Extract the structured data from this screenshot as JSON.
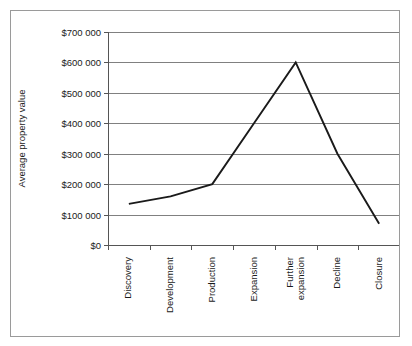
{
  "chart_data": {
    "type": "line",
    "title": "",
    "subtitle": "",
    "xlabel": "",
    "ylabel": "Average property value",
    "categories": [
      "Discovery",
      "Development",
      "Production",
      "Expansion",
      "Further expansion",
      "Decline",
      "Closure"
    ],
    "series": [
      {
        "name": "Average property value",
        "values": [
          135000,
          160000,
          200000,
          400000,
          600000,
          300000,
          70000
        ]
      }
    ],
    "ylim": [
      0,
      700000
    ],
    "ytick_values": [
      0,
      100000,
      200000,
      300000,
      400000,
      500000,
      600000,
      700000
    ],
    "ytick_labels": [
      "$0",
      "$100 000",
      "$200 000",
      "$300 000",
      "$400 000",
      "$500 000",
      "$600 000",
      "$700 000"
    ],
    "grid": true,
    "grid_axis": "y",
    "legend": false,
    "legend_position": "none",
    "line_color": "#1a1a1a",
    "grid_color": "#808080",
    "axis_color": "#555555",
    "plot_background": "#ffffff",
    "border_color": "#9a9a9a",
    "markers": false,
    "annotations": []
  },
  "chart_labels": {
    "x_tick_lines": [
      [
        "Discovery"
      ],
      [
        "Development"
      ],
      [
        "Production"
      ],
      [
        "Expansion"
      ],
      [
        "Further",
        "expansion"
      ],
      [
        "Decline"
      ],
      [
        "Closure"
      ]
    ]
  }
}
